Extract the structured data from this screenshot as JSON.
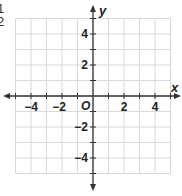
{
  "corner_labels": [
    "1",
    "2"
  ],
  "axes": {
    "x_label": "x",
    "y_label": "y",
    "origin_label": "O"
  },
  "grid": {
    "x_min": -5,
    "x_max": 5,
    "y_min": -5,
    "y_max": 5,
    "step": 1,
    "line_color": "#d9d9d9",
    "axis_color": "#333333"
  },
  "x_tick_labels": [
    {
      "value": -4,
      "label": "−4"
    },
    {
      "value": -2,
      "label": "−2"
    },
    {
      "value": 2,
      "label": "2"
    },
    {
      "value": 4,
      "label": "4"
    }
  ],
  "y_tick_labels": [
    {
      "value": 4,
      "label": "4"
    },
    {
      "value": 2,
      "label": "2"
    },
    {
      "value": -2,
      "label": "−2"
    },
    {
      "value": -4,
      "label": "−4"
    }
  ]
}
